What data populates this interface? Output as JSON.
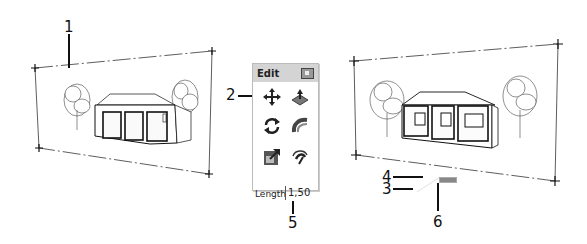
{
  "callouts": {
    "c1": "1",
    "c2": "2",
    "c3": "3",
    "c4": "4",
    "c5": "5",
    "c6": "6"
  },
  "toolbar": {
    "title": "Edit",
    "close_icon": "close-icon",
    "tools": [
      {
        "name": "move",
        "icon": "move-icon"
      },
      {
        "name": "push-pull",
        "icon": "push-pull-icon"
      },
      {
        "name": "rotate",
        "icon": "rotate-icon"
      },
      {
        "name": "follow-me",
        "icon": "follow-me-icon"
      },
      {
        "name": "scale",
        "icon": "scale-icon"
      },
      {
        "name": "offset",
        "icon": "offset-icon"
      }
    ]
  },
  "measurements": {
    "label": "Length",
    "value": "1,50"
  },
  "colors": {
    "line": "#111111",
    "toolbar_header": "#d4d4d4",
    "accent_arrow": "#222222"
  }
}
